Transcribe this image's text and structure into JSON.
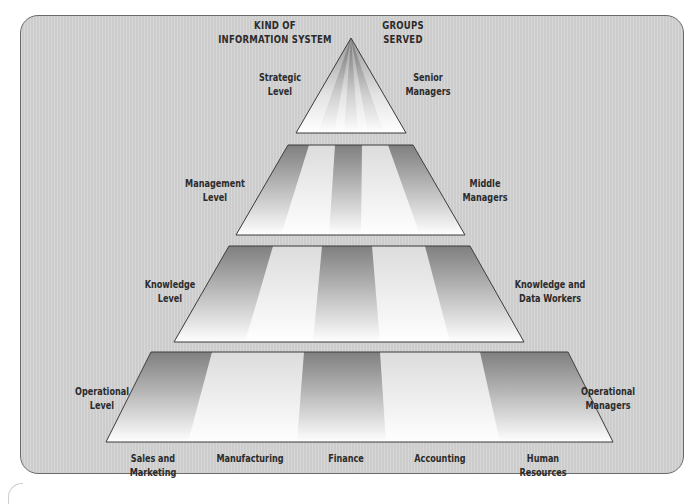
{
  "headers": {
    "left": [
      "KIND OF",
      "INFORMATION SYSTEM"
    ],
    "right": [
      "GROUPS",
      "SERVED"
    ]
  },
  "levels": [
    {
      "name": "strategic",
      "system_label": [
        "Strategic",
        "Level"
      ],
      "group_label": [
        "Senior",
        "Managers"
      ]
    },
    {
      "name": "management",
      "system_label": [
        "Management",
        "Level"
      ],
      "group_label": [
        "Middle",
        "Managers"
      ]
    },
    {
      "name": "knowledge",
      "system_label": [
        "Knowledge",
        "Level"
      ],
      "group_label": [
        "Knowledge and",
        "Data Workers"
      ]
    },
    {
      "name": "operational",
      "system_label": [
        "Operational",
        "Level"
      ],
      "group_label": [
        "Operational",
        "Managers"
      ]
    }
  ],
  "functional_areas": [
    [
      "Sales and",
      "Marketing"
    ],
    [
      "Manufacturing"
    ],
    [
      "Finance"
    ],
    [
      "Accounting"
    ],
    [
      "Human",
      "Resources"
    ]
  ],
  "colors": {
    "panel_bg": "#d3d3d3",
    "panel_border": "#6a6a6a",
    "tier_dark": "#8e8e8e",
    "tier_light": "#ffffff",
    "text": "#2b2b2b"
  }
}
